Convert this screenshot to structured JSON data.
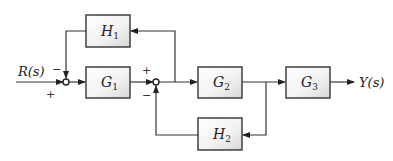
{
  "diagram": {
    "type": "control-system-block-diagram",
    "input": {
      "label": "R(s)"
    },
    "output": {
      "label": "Y(s)"
    },
    "blocks": [
      {
        "id": "G1",
        "name": "G",
        "sub": "1"
      },
      {
        "id": "G2",
        "name": "G",
        "sub": "2"
      },
      {
        "id": "G3",
        "name": "G",
        "sub": "3"
      },
      {
        "id": "H1",
        "name": "H",
        "sub": "1"
      },
      {
        "id": "H2",
        "name": "H",
        "sub": "2"
      }
    ],
    "junctions": [
      {
        "id": "S1",
        "signs": {
          "top": "−",
          "left": "+"
        }
      },
      {
        "id": "S2",
        "signs": {
          "left": "+",
          "bottom": "−"
        }
      }
    ],
    "connections": [
      "R(s) -> S1 (+)",
      "S1 -> G1",
      "G1 -> S2 (+)",
      "S2 -> G2",
      "S2 output pickoff -> H1 -> S1 (−)",
      "G2 -> G3",
      "G2 output pickoff -> H2 -> S2 (−)",
      "G3 -> Y(s)"
    ]
  }
}
